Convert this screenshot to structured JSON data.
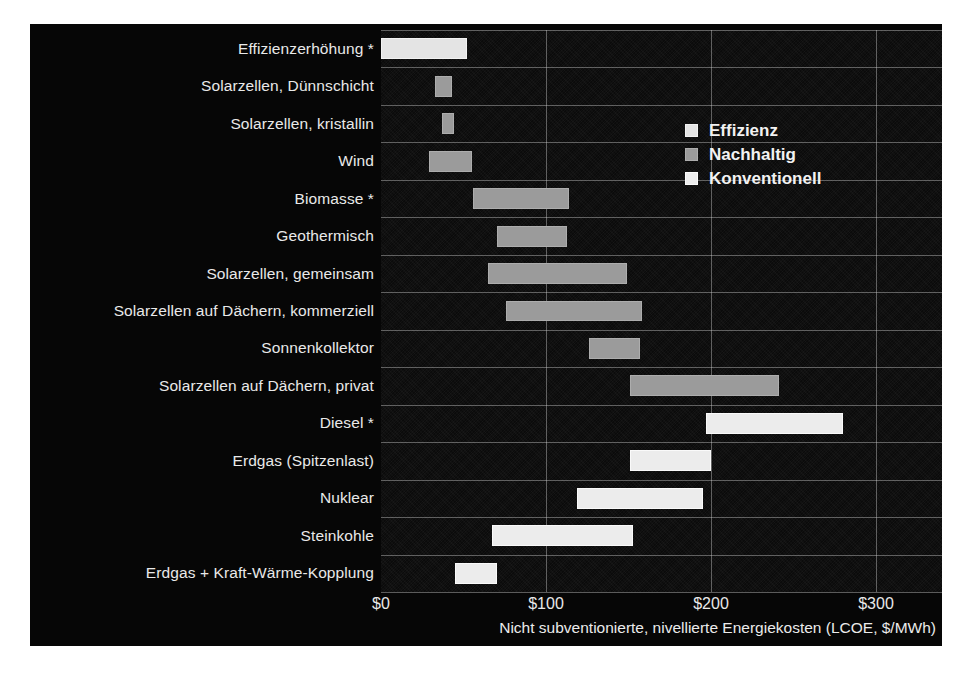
{
  "chart_data": {
    "type": "bar",
    "subtype": "floating-range-bar",
    "title": "",
    "xlabel": "Nicht subventionierte, nivellierte Energiekosten (LCOE, $/MWh)",
    "ylabel": "",
    "xlim": [
      0,
      340
    ],
    "xticks": [
      0,
      100,
      200,
      300
    ],
    "xticklabels": [
      "$0",
      "$100",
      "$200",
      "$300"
    ],
    "grid": true,
    "legend_position": "upper-right-inside",
    "legend": [
      {
        "name": "Effizienz",
        "color": "#E4E4E4"
      },
      {
        "name": "Nachhaltig",
        "color": "#9B9B9B"
      },
      {
        "name": "Konventionell",
        "color": "#ECECEC"
      }
    ],
    "categories": [
      "Effizienzerhöhung *",
      "Solarzellen, Dünnschicht",
      "Solarzellen, kristallin",
      "Wind",
      "Biomasse *",
      "Geothermisch",
      "Solarzellen, gemeinsam",
      "Solarzellen auf Dächern, kommerziell",
      "Sonnenkollektor",
      "Solarzellen auf Dächern, privat",
      "Diesel *",
      "Erdgas (Spitzenlast)",
      "Nuklear",
      "Steinkohle",
      "Erdgas + Kraft-Wärme-Kopplung"
    ],
    "bars": [
      {
        "category": "Effizienzerhöhung *",
        "low": 0,
        "high": 52,
        "series": "Effizienz"
      },
      {
        "category": "Solarzellen, Dünnschicht",
        "low": 33,
        "high": 43,
        "series": "Nachhaltig"
      },
      {
        "category": "Solarzellen, kristallin",
        "low": 37,
        "high": 44,
        "series": "Nachhaltig"
      },
      {
        "category": "Wind",
        "low": 29,
        "high": 55,
        "series": "Nachhaltig"
      },
      {
        "category": "Biomasse *",
        "low": 56,
        "high": 114,
        "series": "Nachhaltig"
      },
      {
        "category": "Geothermisch",
        "low": 70,
        "high": 113,
        "series": "Nachhaltig"
      },
      {
        "category": "Solarzellen, gemeinsam",
        "low": 65,
        "high": 149,
        "series": "Nachhaltig"
      },
      {
        "category": "Solarzellen auf Dächern, kommerziell",
        "low": 76,
        "high": 158,
        "series": "Nachhaltig"
      },
      {
        "category": "Sonnenkollektor",
        "low": 126,
        "high": 157,
        "series": "Nachhaltig"
      },
      {
        "category": "Solarzellen auf Dächern, privat",
        "low": 151,
        "high": 241,
        "series": "Nachhaltig"
      },
      {
        "category": "Diesel *",
        "low": 197,
        "high": 280,
        "series": "Konventionell"
      },
      {
        "category": "Erdgas (Spitzenlast)",
        "low": 151,
        "high": 200,
        "series": "Konventionell"
      },
      {
        "category": "Nuklear",
        "low": 119,
        "high": 195,
        "series": "Konventionell"
      },
      {
        "category": "Steinkohle",
        "low": 67,
        "high": 153,
        "series": "Konventionell"
      },
      {
        "category": "Erdgas + Kraft-Wärme-Kopplung",
        "low": 45,
        "high": 70,
        "series": "Konventionell"
      }
    ]
  },
  "chart": {
    "axis_title": "Nicht subventionierte, nivellierte Energiekosten (LCOE, $/MWh)"
  }
}
